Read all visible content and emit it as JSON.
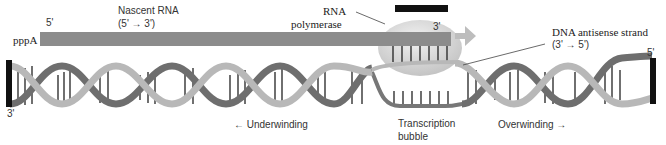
{
  "labels": {
    "rna_5prime": "5'",
    "nascent_rna": "Nascent RNA",
    "nascent_rna_direction": "(5' → 3')",
    "ppp_a": "pppA",
    "rna_polymerase_line1": "RNA",
    "rna_polymerase_line2": "polymerase",
    "rna_3prime": "3'",
    "dna_antisense": "DNA antisense strand",
    "dna_antisense_direction": "(3' → 5')",
    "dna_right_5prime": "5'",
    "dna_left_3prime": "3'",
    "underwinding": "← Underwinding",
    "transcription_bubble_line1": "Transcription",
    "transcription_bubble_line2": "bubble",
    "overwinding": "Overwinding →"
  },
  "colors": {
    "rna_bar": "#8c8c8c",
    "polymerase": "#d9d9d9",
    "strand_light": "#b5b5b5",
    "strand_dark": "#6e6e6e",
    "end_cap": "#111111",
    "arrow": "#bdbdbd"
  }
}
